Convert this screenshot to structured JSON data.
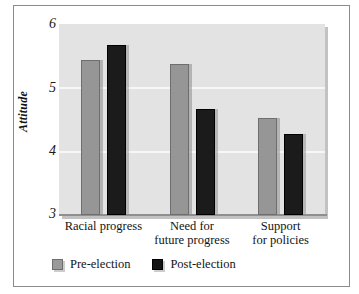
{
  "chart_data": {
    "type": "bar",
    "title": "",
    "subtitle": "",
    "xlabel": "",
    "ylabel": "Attitude",
    "ylim": [
      3,
      6
    ],
    "yticks": [
      "3",
      "4",
      "5",
      "6"
    ],
    "grid": true,
    "legend_position": "bottom-left",
    "categories": [
      "Racial progress",
      "Need for future progress",
      "Support for policies"
    ],
    "category_lines": [
      [
        "Racial progress"
      ],
      [
        "Need for",
        "future progress"
      ],
      [
        "Support",
        "for policies"
      ]
    ],
    "series": [
      {
        "name": "Pre-election",
        "color": "#969696",
        "values": [
          5.43,
          5.37,
          4.52
        ]
      },
      {
        "name": "Post-election",
        "color": "#1b1b1b",
        "values": [
          5.67,
          4.66,
          4.27
        ]
      }
    ]
  },
  "legend": {
    "items": [
      {
        "label": "Pre-election",
        "swatch": "pre-election-swatch"
      },
      {
        "label": "Post-election",
        "swatch": "post-election-swatch"
      }
    ]
  },
  "axis": {
    "y_title": "Attitude",
    "y_ticks": [
      "6",
      "5",
      "4",
      "3"
    ]
  }
}
